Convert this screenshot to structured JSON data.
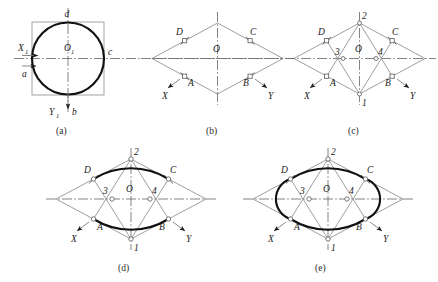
{
  "figure": {
    "panels": [
      {
        "id": "a",
        "caption": "(a)",
        "description": "Circle inscribed in square with X1 Y1 axes",
        "labels": {
          "top": "d",
          "right": "c",
          "bottom": "b",
          "left": "a",
          "center": "O",
          "center_sub": "1",
          "axis_x": "X",
          "axis_x_sub": "1",
          "axis_y": "Y",
          "axis_y_sub": "1"
        }
      },
      {
        "id": "b",
        "caption": "(b)",
        "description": "Isometric rhombus with midpoints A B C D",
        "labels": {
          "center": "O",
          "upper_left": "D",
          "upper_right": "C",
          "lower_left": "A",
          "lower_right": "B",
          "axis_x": "X",
          "axis_y": "Y"
        }
      },
      {
        "id": "c",
        "caption": "(c)",
        "description": "Construction lines from vertices 1 and 2 locating centers 3 and 4",
        "labels": {
          "center": "O",
          "upper_left": "D",
          "upper_right": "C",
          "lower_left": "A",
          "lower_right": "B",
          "vertex_top": "2",
          "vertex_bottom": "1",
          "center_left": "3",
          "center_right": "4",
          "axis_x": "X",
          "axis_y": "Y"
        }
      },
      {
        "id": "d",
        "caption": "(d)",
        "description": "Large arcs DC and AB drawn from centers 1 and 2",
        "labels": {
          "center": "O",
          "upper_left": "D",
          "upper_right": "C",
          "lower_left": "A",
          "lower_right": "B",
          "vertex_top": "2",
          "vertex_bottom": "1",
          "center_left": "3",
          "center_right": "4",
          "axis_x": "X",
          "axis_y": "Y"
        }
      },
      {
        "id": "e",
        "caption": "(e)",
        "description": "Completed ellipse with small arcs AD and BC from centers 3 and 4",
        "labels": {
          "center": "O",
          "upper_left": "D",
          "upper_right": "C",
          "lower_left": "A",
          "lower_right": "B",
          "vertex_top": "2",
          "vertex_bottom": "1",
          "center_left": "3",
          "center_right": "4",
          "axis_x": "X",
          "axis_y": "Y"
        }
      }
    ],
    "colors": {
      "thick_line": "#111111",
      "thin_line": "#8c8c8c",
      "center_line": "#6e6e6e",
      "text": "#1a1a1a",
      "background": "#ffffff"
    }
  }
}
